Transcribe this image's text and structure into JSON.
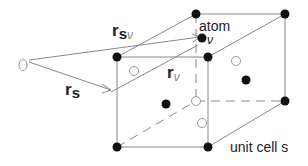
{
  "diagram": {
    "labels": {
      "r_s_nu_main": "r",
      "r_s_nu_sub": "s",
      "r_s_nu_nu": "ν",
      "r_s_main": "r",
      "r_s_sub": "s",
      "r_nu_main": "r",
      "r_nu_sub": "ν",
      "atom": "atom",
      "atom_nu": "ν",
      "unit_cell": "unit cell s"
    },
    "colors": {
      "line": "#888888",
      "filled_atom": "#111111",
      "open_atom": "#999999",
      "text": "#222222"
    },
    "origin": {
      "x": 23,
      "y": 65
    },
    "cube": {
      "front": {
        "tl": [
          117,
          57
        ],
        "tr": [
          208,
          57
        ],
        "br": [
          208,
          147
        ],
        "bl": [
          117,
          147
        ]
      },
      "back": {
        "tl": [
          196,
          14
        ],
        "tr": [
          285,
          14
        ],
        "br": [
          285,
          101
        ],
        "bl": [
          196,
          101
        ]
      }
    },
    "filled_atoms": [
      [
        117,
        57
      ],
      [
        208,
        57
      ],
      [
        196,
        14
      ],
      [
        285,
        14
      ],
      [
        285,
        101
      ],
      [
        117,
        147
      ],
      [
        208,
        147
      ],
      [
        202,
        38
      ],
      [
        166,
        103
      ],
      [
        246,
        80
      ]
    ],
    "open_atoms": [
      [
        236,
        61
      ],
      [
        134,
        71
      ],
      [
        196,
        101
      ],
      [
        203,
        122
      ],
      [
        23,
        65
      ]
    ]
  }
}
